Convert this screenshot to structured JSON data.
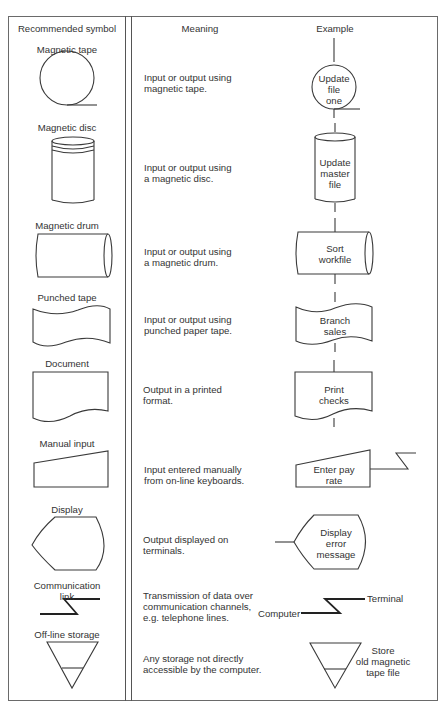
{
  "headers": {
    "symbol": "Recommended symbol",
    "meaning": "Meaning",
    "example": "Example"
  },
  "rows": [
    {
      "symbol": "Magnetic tape",
      "meaning": "Input or output using\nmagnetic tape.",
      "example": "Update\nfile\none"
    },
    {
      "symbol": "Magnetic disc",
      "meaning": "Input or output using\na magnetic disc.",
      "example": "Update\nmaster\nfile"
    },
    {
      "symbol": "Magnetic drum",
      "meaning": "Input or output using\na magnetic drum.",
      "example": "Sort\nworkfile"
    },
    {
      "symbol": "Punched tape",
      "meaning": "Input or output using\npunched paper tape.",
      "example": "Branch\nsales"
    },
    {
      "symbol": "Document",
      "meaning": "Output in a printed\nformat.",
      "example": "Print\nchecks"
    },
    {
      "symbol": "Manual input",
      "meaning": "Input entered manually\nfrom on-line keyboards.",
      "example": "Enter pay\nrate"
    },
    {
      "symbol": "Display",
      "meaning": "Output displayed on\nterminals.",
      "example": "Display\nerror\nmessage"
    },
    {
      "symbol": "Communication\nlink",
      "meaning": "Transmission of data over\ncommunication channels,\ne.g. telephone lines.",
      "example_left": "Computer",
      "example_right": "Terminal"
    },
    {
      "symbol": "Off-line storage",
      "meaning": "Any storage not directly\naccessible by the computer.",
      "example": "Store\nold magnetic\ntape file"
    }
  ]
}
